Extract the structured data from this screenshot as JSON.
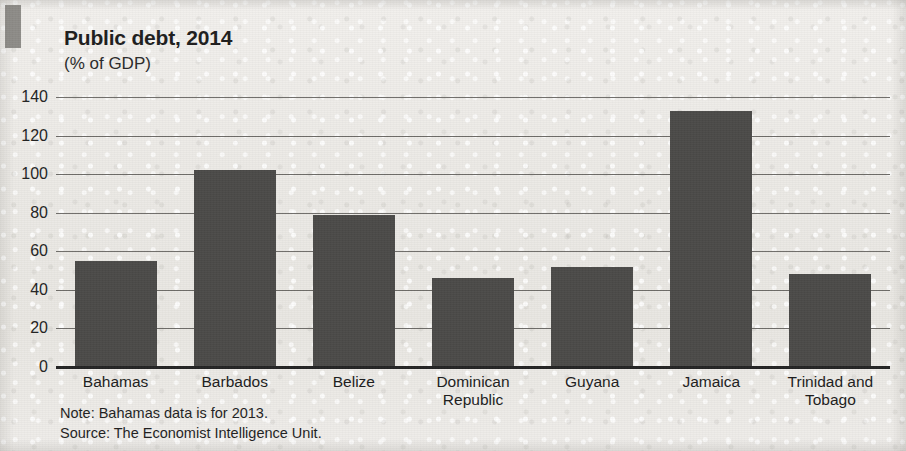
{
  "chart_data": {
    "type": "bar",
    "title": "Public debt, 2014",
    "subtitle": "(% of GDP)",
    "xlabel": "",
    "ylabel": "",
    "ylim": [
      0,
      140
    ],
    "yticks": [
      0,
      20,
      40,
      60,
      80,
      100,
      120,
      140
    ],
    "ytick_labels": [
      "0",
      "20",
      "40",
      "60",
      "80",
      "100",
      "120",
      "140"
    ],
    "grid": true,
    "legend": null,
    "bar_color": "#4b4a48",
    "categories": [
      "Bahamas",
      "Barbados",
      "Belize",
      "Dominican Republic",
      "Guyana",
      "Jamaica",
      "Trinidad and Tobago"
    ],
    "category_lines": [
      [
        "Bahamas",
        ""
      ],
      [
        "Barbados",
        ""
      ],
      [
        "Belize",
        ""
      ],
      [
        "Dominican",
        "Republic"
      ],
      [
        "Guyana",
        ""
      ],
      [
        "Jamaica",
        ""
      ],
      [
        "Trinidad and",
        "Tobago"
      ]
    ],
    "values": [
      55,
      102,
      79,
      46,
      52,
      133,
      48
    ],
    "notes": [
      "Note: Bahamas data is for 2013.",
      "Source: The Economist Intelligence Unit."
    ]
  }
}
